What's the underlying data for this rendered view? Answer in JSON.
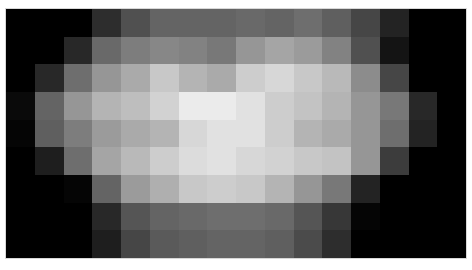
{
  "chart_data": {
    "type": "heatmap",
    "title": "",
    "xlabel": "",
    "ylabel": "",
    "colormap": "grayscale",
    "value_range": [
      0,
      255
    ],
    "rows": 9,
    "cols": 16,
    "grid": false,
    "legend": "none",
    "values": [
      [
        0,
        0,
        0,
        45,
        80,
        100,
        100,
        100,
        105,
        100,
        110,
        95,
        70,
        35,
        0,
        0
      ],
      [
        0,
        0,
        40,
        105,
        125,
        135,
        130,
        120,
        150,
        165,
        155,
        130,
        80,
        20,
        0,
        0
      ],
      [
        0,
        40,
        110,
        150,
        170,
        200,
        180,
        170,
        205,
        215,
        200,
        185,
        140,
        70,
        0,
        0
      ],
      [
        10,
        100,
        150,
        180,
        190,
        210,
        235,
        235,
        225,
        205,
        195,
        180,
        150,
        120,
        40,
        0
      ],
      [
        5,
        95,
        125,
        155,
        170,
        180,
        215,
        225,
        225,
        205,
        180,
        170,
        150,
        110,
        35,
        0
      ],
      [
        0,
        30,
        110,
        165,
        185,
        205,
        220,
        225,
        215,
        210,
        200,
        195,
        150,
        60,
        0,
        0
      ],
      [
        0,
        0,
        5,
        100,
        155,
        175,
        200,
        205,
        200,
        180,
        150,
        120,
        35,
        0,
        0,
        0
      ],
      [
        0,
        0,
        0,
        40,
        85,
        100,
        105,
        110,
        110,
        105,
        85,
        55,
        5,
        0,
        0,
        0
      ],
      [
        0,
        0,
        0,
        30,
        70,
        90,
        95,
        100,
        100,
        95,
        75,
        45,
        0,
        0,
        0,
        0
      ]
    ]
  }
}
